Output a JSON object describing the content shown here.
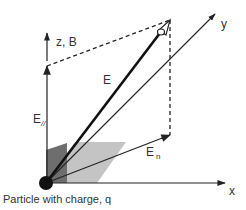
{
  "diagram": {
    "labels": {
      "z_axis": "z, B",
      "y_axis": "y",
      "x_axis": "x",
      "e_vector": "E",
      "e_parallel_main": "E",
      "e_parallel_sub": "//",
      "e_normal_main": "E",
      "e_normal_sub": "n",
      "particle_caption": "Particle with charge, q"
    },
    "colors": {
      "line": "#222222",
      "dark_plane": "#6e6e6e",
      "light_plane": "#c4c4c4",
      "particle": "#111111",
      "text": "#333333"
    },
    "elements": [
      {
        "id": "particle",
        "type": "dot",
        "description": "charged particle at origin"
      },
      {
        "id": "z-axis",
        "type": "arrow",
        "label": "z, B"
      },
      {
        "id": "x-axis",
        "type": "arrow",
        "label": "x"
      },
      {
        "id": "y-axis",
        "type": "arrow",
        "label": "y"
      },
      {
        "id": "e-vector",
        "type": "thick-arrow",
        "label": "E"
      },
      {
        "id": "e-parallel",
        "type": "arrow",
        "label": "E//"
      },
      {
        "id": "e-normal",
        "type": "arrow",
        "label": "En"
      },
      {
        "id": "dashed-projection-top",
        "type": "dashed-line"
      },
      {
        "id": "dashed-projection-vertical",
        "type": "dashed-line"
      },
      {
        "id": "dark-plane",
        "type": "shaded-plane"
      },
      {
        "id": "light-plane",
        "type": "shaded-plane"
      }
    ]
  }
}
